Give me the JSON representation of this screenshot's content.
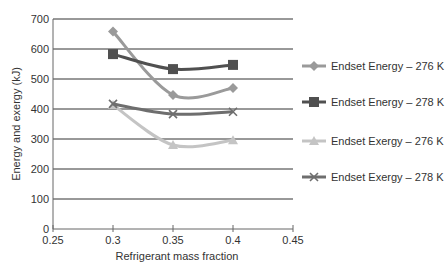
{
  "chart_data": {
    "type": "line",
    "title": "",
    "xlabel": "Refrigerant mass fraction",
    "ylabel": "Energy and exergy (kJ)",
    "xlim": [
      0.25,
      0.45
    ],
    "ylim": [
      0,
      700
    ],
    "x_ticks": [
      "0.25",
      "0.3",
      "0.35",
      "0.4",
      "0.45"
    ],
    "y_ticks": [
      "0",
      "100",
      "200",
      "300",
      "400",
      "500",
      "600",
      "700"
    ],
    "grid": "horizontal",
    "legend_position": "right",
    "x": [
      0.3,
      0.35,
      0.4
    ],
    "series": [
      {
        "name": "Endset Energy – 276 K",
        "values": [
          658,
          447,
          470
        ],
        "marker": "diamond",
        "color": "#9a9a9a"
      },
      {
        "name": "Endset Energy – 278 K",
        "values": [
          583,
          533,
          547
        ],
        "marker": "square",
        "color": "#505050"
      },
      {
        "name": "Endset Exergy – 276 K",
        "values": [
          413,
          280,
          296
        ],
        "marker": "triangle",
        "color": "#c4c4c4"
      },
      {
        "name": "Endset Exergy – 278 K",
        "values": [
          417,
          383,
          391
        ],
        "marker": "x",
        "color": "#6e6e6e"
      }
    ]
  }
}
